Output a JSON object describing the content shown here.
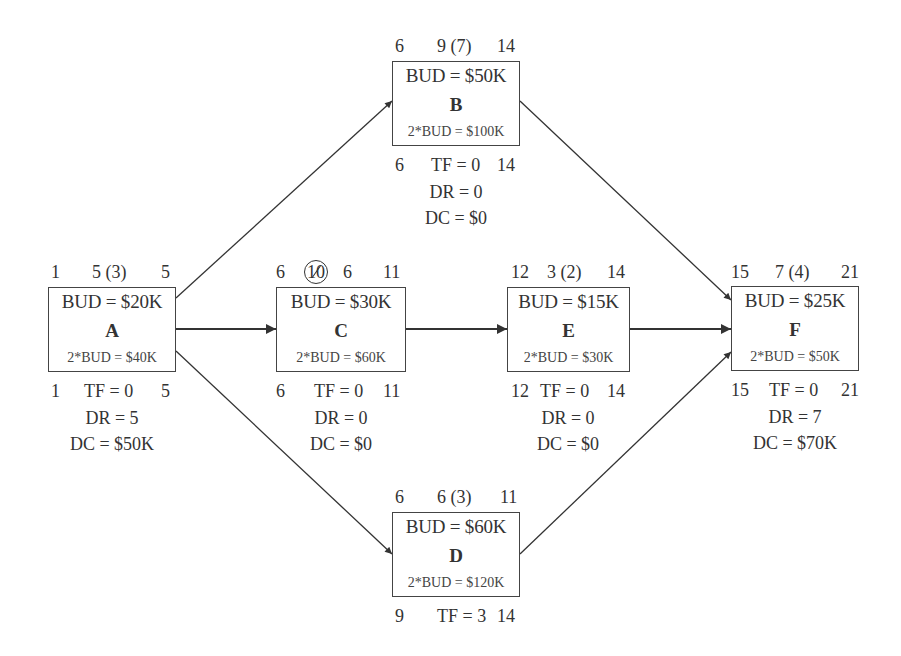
{
  "diagram": {
    "type": "activity-on-node network with crashing costs",
    "nodes": [
      {
        "id": "A",
        "top": {
          "es": "1",
          "dur": "5 (3)",
          "ef": "5"
        },
        "bud": "BUD = $20K",
        "label": "A",
        "bud2": "2*BUD = $40K",
        "bottom": {
          "ls": "1",
          "tf": "TF = 0",
          "lf": "5"
        },
        "dr": "DR = 5",
        "dc": "DC = $50K"
      },
      {
        "id": "B",
        "top": {
          "es": "6",
          "dur": "9 (7)",
          "ef": "14"
        },
        "bud": "BUD = $50K",
        "label": "B",
        "bud2": "2*BUD = $100K",
        "bottom": {
          "ls": "6",
          "tf": "TF = 0",
          "lf": "14"
        },
        "dr": "DR = 0",
        "dc": "DC = $0"
      },
      {
        "id": "C",
        "top": {
          "es": "6",
          "dur_struck": "10",
          "dur": "6",
          "ef": "11"
        },
        "bud": "BUD = $30K",
        "label": "C",
        "bud2": "2*BUD = $60K",
        "bottom": {
          "ls": "6",
          "tf": "TF = 0",
          "lf": "11"
        },
        "dr": "DR = 0",
        "dc": "DC = $0"
      },
      {
        "id": "D",
        "top": {
          "es": "6",
          "dur": "6 (3)",
          "ef": "11"
        },
        "bud": "BUD = $60K",
        "label": "D",
        "bud2": "2*BUD = $120K",
        "bottom": {
          "ls": "9",
          "tf": "TF = 3",
          "lf": "14"
        }
      },
      {
        "id": "E",
        "top": {
          "es": "12",
          "dur": "3 (2)",
          "ef": "14"
        },
        "bud": "BUD = $15K",
        "label": "E",
        "bud2": "2*BUD = $30K",
        "bottom": {
          "ls": "12",
          "tf": "TF = 0",
          "lf": "14"
        },
        "dr": "DR = 0",
        "dc": "DC = $0"
      },
      {
        "id": "F",
        "top": {
          "es": "15",
          "dur": "7 (4)",
          "ef": "21"
        },
        "bud": "BUD = $25K",
        "label": "F",
        "bud2": "2*BUD = $50K",
        "bottom": {
          "ls": "15",
          "tf": "TF = 0",
          "lf": "21"
        },
        "dr": "DR = 7",
        "dc": "DC = $70K"
      }
    ],
    "edges": [
      {
        "from": "A",
        "to": "B"
      },
      {
        "from": "A",
        "to": "C"
      },
      {
        "from": "A",
        "to": "D"
      },
      {
        "from": "C",
        "to": "E"
      },
      {
        "from": "B",
        "to": "F"
      },
      {
        "from": "E",
        "to": "F"
      },
      {
        "from": "D",
        "to": "F"
      }
    ],
    "colors": {
      "line": "#333333",
      "text": "#333333",
      "background": "#ffffff"
    }
  }
}
